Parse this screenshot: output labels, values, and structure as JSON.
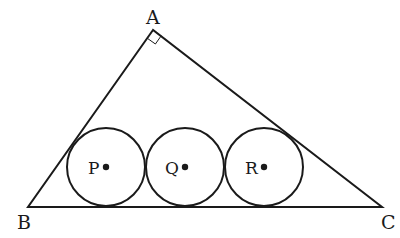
{
  "diagram": {
    "vertices": {
      "A": {
        "label": "A",
        "x": 153,
        "y": 30
      },
      "B": {
        "label": "B",
        "x": 28,
        "y": 207
      },
      "C": {
        "label": "C",
        "x": 382,
        "y": 207
      }
    },
    "right_angle_at": "A",
    "circles": [
      {
        "label": "P",
        "cx": 106,
        "cy": 167,
        "r": 39
      },
      {
        "label": "Q",
        "cx": 185,
        "cy": 167,
        "r": 39
      },
      {
        "label": "R",
        "cx": 264,
        "cy": 167,
        "r": 39
      }
    ],
    "colors": {
      "stroke": "#1a1a1a",
      "background": "#ffffff"
    }
  }
}
